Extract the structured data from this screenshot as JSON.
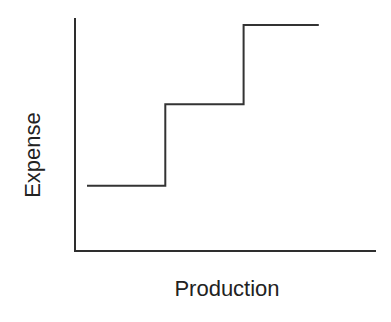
{
  "chart_data": {
    "type": "line",
    "subtype": "step",
    "title": "",
    "xlabel": "Production",
    "ylabel": "Expense",
    "grid": false,
    "legend": null,
    "x_ticks": [],
    "y_ticks": [],
    "series": [
      {
        "name": "Expense",
        "color": "#333333",
        "segments": [
          {
            "x_start": 0.04,
            "x_end": 0.3,
            "y": 0.28
          },
          {
            "x_start": 0.3,
            "x_end": 0.56,
            "y": 0.63
          },
          {
            "x_start": 0.56,
            "x_end": 0.81,
            "y": 0.97
          }
        ]
      }
    ],
    "xlim": [
      0,
      1
    ],
    "ylim": [
      0,
      1
    ]
  },
  "labels": {
    "x": "Production",
    "y": "Expense"
  },
  "colors": {
    "axis": "#2e2e2e",
    "line": "#333333",
    "text": "#222222",
    "background": "#ffffff"
  }
}
